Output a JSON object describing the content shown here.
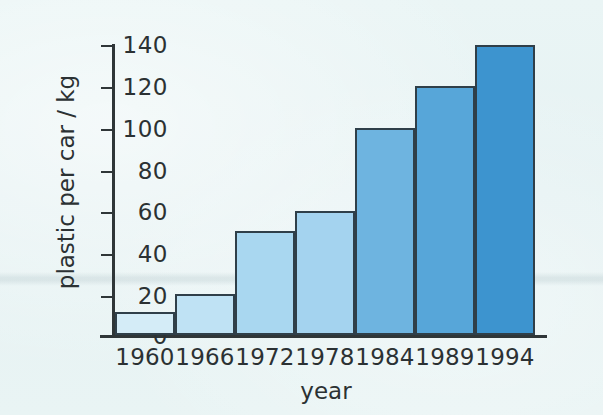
{
  "chart_data": {
    "type": "bar",
    "title": "",
    "xlabel": "year",
    "ylabel": "plastic per car / kg",
    "categories": [
      "1960",
      "1966",
      "1972",
      "1978",
      "1984",
      "1989",
      "1994"
    ],
    "values": [
      11,
      20,
      50,
      60,
      100,
      120,
      140
    ],
    "ylim": [
      0,
      140
    ],
    "ytick_labels": [
      "140",
      "120",
      "100",
      "80",
      "60",
      "40",
      "20",
      "0"
    ],
    "ytick_values": [
      140,
      120,
      100,
      80,
      60,
      40,
      20,
      0
    ],
    "ytick_step": 20,
    "grid": false,
    "legend": "none",
    "bar_colors": [
      "#d4ecf7",
      "#bfe2f4",
      "#a9d7f0",
      "#a4d3ef",
      "#6eb4e0",
      "#57a6d9",
      "#3d94cf"
    ],
    "bar_edge_color": "#2f3f49",
    "axis_color": "#2f3638",
    "background_color": "#e8f4f4",
    "text_color": "#2b3133"
  }
}
